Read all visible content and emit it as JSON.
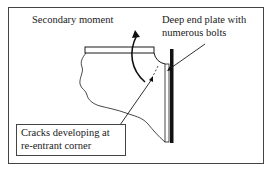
{
  "diagram": {
    "labels": {
      "secondary_moment": "Secondary moment",
      "end_plate_line1": "Deep end plate with",
      "end_plate_line2": "numerous bolts",
      "cracks_line1": "Cracks developing at",
      "cracks_line2": "re-entrant corner"
    },
    "components": {
      "beam_flange": "top flange (horizontal plate)",
      "beam_section": "broken-off beam web with irregular break line",
      "end_plate": "thin vertical end plate",
      "column_flange": "thick black vertical column line",
      "moment_arrow": "curved arrow indicating secondary moment",
      "re_entrant_corner": "curved fillet at flange/plate junction"
    },
    "colors": {
      "line": "#1a1a1a",
      "frame": "#444444",
      "background": "#ffffff"
    }
  }
}
